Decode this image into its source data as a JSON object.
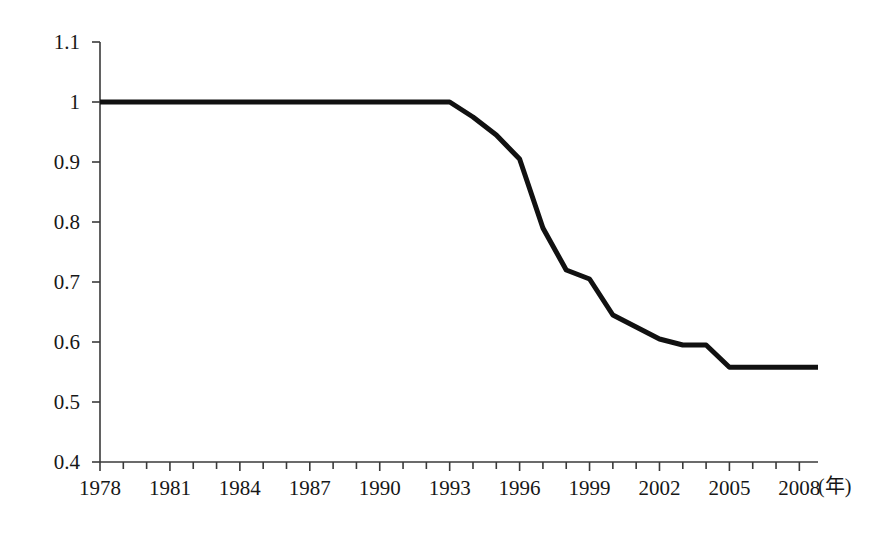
{
  "chart_data": {
    "type": "line",
    "title": "",
    "subtitle": "",
    "xlabel": "(年)",
    "ylabel": "",
    "xlim": [
      1978,
      2008.8
    ],
    "ylim": [
      0.4,
      1.1
    ],
    "grid": false,
    "legend": null,
    "y_ticks": [
      "1.1",
      "1",
      "0.9",
      "0.8",
      "0.7",
      "0.6",
      "0.5",
      "0.4"
    ],
    "y_tick_values": [
      1.1,
      1.0,
      0.9,
      0.8,
      0.7,
      0.6,
      0.5,
      0.4
    ],
    "x_ticks": [
      "1978",
      "1981",
      "1984",
      "1987",
      "1990",
      "1993",
      "1996",
      "1999",
      "2002",
      "2005",
      "2008"
    ],
    "x_tick_values": [
      1978,
      1981,
      1984,
      1987,
      1990,
      1993,
      1996,
      1999,
      2002,
      2005,
      2008
    ],
    "x_minor_tick_step": 1,
    "series": [
      {
        "name": "series-1",
        "color": "#111111",
        "line_width": 5,
        "x": [
          1978,
          1979,
          1980,
          1981,
          1982,
          1983,
          1984,
          1985,
          1986,
          1987,
          1988,
          1989,
          1990,
          1991,
          1992,
          1993,
          1994,
          1995,
          1996,
          1997,
          1998,
          1999,
          2000,
          2001,
          2002,
          2003,
          2004,
          2005,
          2006,
          2007,
          2008,
          2008.8
        ],
        "values": [
          1.0,
          1.0,
          1.0,
          1.0,
          1.0,
          1.0,
          1.0,
          1.0,
          1.0,
          1.0,
          1.0,
          1.0,
          1.0,
          1.0,
          1.0,
          1.0,
          0.975,
          0.945,
          0.905,
          0.79,
          0.72,
          0.705,
          0.645,
          0.625,
          0.605,
          0.595,
          0.595,
          0.558,
          0.558,
          0.558,
          0.558,
          0.558
        ]
      }
    ]
  },
  "axes": {
    "x_unit": "(年)"
  }
}
